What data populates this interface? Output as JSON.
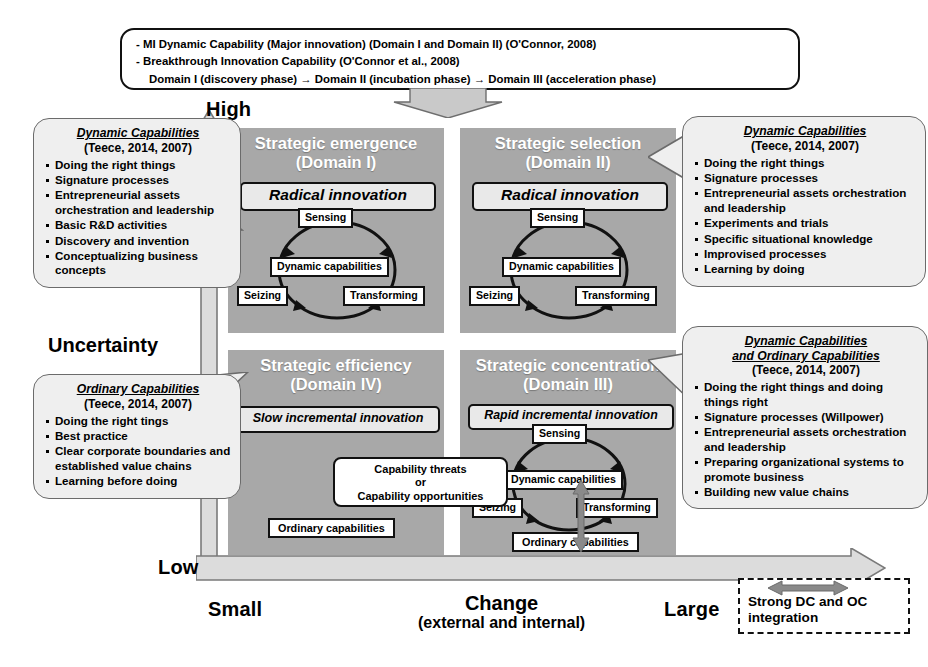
{
  "top_box": {
    "lines": [
      "- MI Dynamic Capability (Major innovation) (Domain I and Domain II) (O'Connor, 2008)",
      "- Breakthrough Innovation Capability (O'Connor et al., 2008)",
      "Domain I (discovery phase) → Domain II (incubation phase) → Domain III (acceleration phase)"
    ]
  },
  "axes": {
    "y_high": "High",
    "y_low": "Low",
    "y_label": "Uncertainty",
    "x_small": "Small",
    "x_large": "Large",
    "x_label": "Change",
    "x_sublabel": "(external and internal)"
  },
  "quadrants": {
    "q1": {
      "title": "Strategic emergence",
      "subtitle": "(Domain I)",
      "innovation": "Radical innovation",
      "cycle": {
        "center": "Dynamic capabilities",
        "top": "Sensing",
        "left": "Seizing",
        "right": "Transforming"
      }
    },
    "q2": {
      "title": "Strategic selection",
      "subtitle": "(Domain II)",
      "innovation": "Radical innovation",
      "cycle": {
        "center": "Dynamic capabilities",
        "top": "Sensing",
        "left": "Seizing",
        "right": "Transforming"
      }
    },
    "q4": {
      "title": "Strategic efficiency",
      "subtitle": "(Domain IV)",
      "innovation": "Slow incremental  innovation",
      "ordinary": "Ordinary capabilities"
    },
    "q3": {
      "title": "Strategic concentration",
      "subtitle": "(Domain III)",
      "innovation": "Rapid incremental  innovation",
      "ordinary": "Ordinary capabilities",
      "cycle": {
        "center": "Dynamic capabilities",
        "top": "Sensing",
        "left": "Seizing",
        "right": "Transforming"
      }
    }
  },
  "capability_box": {
    "line1": "Capability threats",
    "line2": "or",
    "line3": "Capability opportunities"
  },
  "callouts": {
    "top_left": {
      "heading": "Dynamic Capabilities",
      "source": "(Teece, 2014, 2007)",
      "items": [
        "Doing the right things",
        "Signature processes",
        "Entrepreneurial assets orchestration and leadership",
        "Basic R&D activities",
        "Discovery and invention",
        "Conceptualizing business concepts"
      ]
    },
    "bottom_left": {
      "heading": "Ordinary Capabilities",
      "source": "(Teece, 2014, 2007)",
      "items": [
        "Doing the right tings",
        "Best practice",
        "Clear corporate boundaries and established value chains",
        "Learning before doing"
      ]
    },
    "top_right": {
      "heading": "Dynamic Capabilities",
      "source": "(Teece, 2014, 2007)",
      "items": [
        "Doing the right things",
        "Signature processes",
        "Entrepreneurial assets orchestration and leadership",
        "Experiments and trials",
        "Specific situational knowledge",
        "Improvised processes",
        "Learning by doing"
      ]
    },
    "bottom_right": {
      "heading": "Dynamic Capabilities",
      "heading2": "and Ordinary Capabilities",
      "source": "(Teece, 2014, 2007)",
      "items": [
        "Doing the right things and doing things right",
        "Signature processes (Willpower)",
        "Entrepreneurial assets orchestration and leadership",
        "Preparing organizational systems to promote business",
        "Building new value chains"
      ]
    }
  },
  "dc_oc_box": {
    "line1": "Strong DC and OC",
    "line2": "integration"
  },
  "colors": {
    "quadrant_fill": "#a8a8a8",
    "callout_fill": "#efefef",
    "axis_gray": "#bdbdbd",
    "accent_arrow": "#8a8a8a"
  }
}
